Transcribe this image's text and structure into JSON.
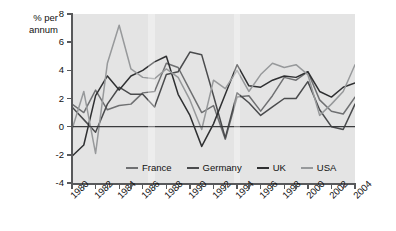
{
  "axis_title": "% per annum",
  "legend": {
    "position": "inside-bottom",
    "items": [
      {
        "label": "France",
        "color": "#6f7072",
        "icon": "legend-line-icon"
      },
      {
        "label": "Germany",
        "color": "#4a4b4d",
        "icon": "legend-line-icon"
      },
      {
        "label": "UK",
        "color": "#2f3032",
        "icon": "legend-line-icon"
      },
      {
        "label": "USA",
        "color": "#97999b",
        "icon": "legend-line-icon"
      }
    ]
  },
  "chart_data": {
    "type": "line",
    "title": "",
    "subtitle": "",
    "xlabel": "",
    "ylabel": "% per annum",
    "ylim": [
      -4,
      8
    ],
    "xlim": [
      1980,
      2004
    ],
    "grid": false,
    "zero_line": true,
    "legend_position": "inside-bottom",
    "y_ticks": [
      -4,
      -2,
      0,
      2,
      4,
      6,
      8
    ],
    "y_tick_labels": [
      "-4",
      "-2",
      "0",
      "2",
      "4",
      "6",
      "8"
    ],
    "x_ticks": [
      1980,
      1981,
      1982,
      1983,
      1984,
      1985,
      1986,
      1987,
      1988,
      1989,
      1990,
      1991,
      1992,
      1993,
      1994,
      1995,
      1996,
      1997,
      1998,
      1999,
      2000,
      2001,
      2002,
      2003,
      2004
    ],
    "x_tick_labels": [
      "1980",
      "1982",
      "1984",
      "1986",
      "1988",
      "1990",
      "1992",
      "1994",
      "1996",
      "1998",
      "2000",
      "2002",
      "2004"
    ],
    "x_labeled_years": [
      1980,
      1982,
      1984,
      1986,
      1988,
      1990,
      1992,
      1994,
      1996,
      1998,
      2000,
      2002,
      2004
    ],
    "x": [
      1980,
      1981,
      1982,
      1983,
      1984,
      1985,
      1986,
      1987,
      1988,
      1989,
      1990,
      1991,
      1992,
      1993,
      1994,
      1995,
      1996,
      1997,
      1998,
      1999,
      2000,
      2001,
      2002,
      2003,
      2004
    ],
    "series": [
      {
        "name": "France",
        "color": "#6f7072",
        "values": [
          1.6,
          1.0,
          2.6,
          1.2,
          1.5,
          1.6,
          2.4,
          2.5,
          4.5,
          4.2,
          2.6,
          1.0,
          1.5,
          -0.9,
          2.1,
          2.2,
          1.1,
          2.2,
          3.5,
          3.3,
          3.9,
          1.9,
          1.1,
          0.9,
          2.1
        ]
      },
      {
        "name": "Germany",
        "color": "#4a4b4d",
        "values": [
          1.4,
          0.5,
          -0.4,
          1.6,
          2.8,
          2.3,
          2.3,
          1.4,
          3.7,
          3.9,
          5.3,
          5.1,
          2.2,
          -0.8,
          2.4,
          1.7,
          0.8,
          1.4,
          2.0,
          2.0,
          3.2,
          1.2,
          0.0,
          -0.2,
          1.6
        ]
      },
      {
        "name": "UK",
        "color": "#2f3032",
        "values": [
          -2.1,
          -1.3,
          2.2,
          3.6,
          2.6,
          3.6,
          4.0,
          4.6,
          5.0,
          2.3,
          0.8,
          -1.4,
          0.2,
          2.3,
          4.4,
          2.9,
          2.8,
          3.3,
          3.6,
          3.5,
          3.9,
          2.5,
          2.1,
          2.8,
          3.1
        ]
      },
      {
        "name": "USA",
        "color": "#97999b",
        "values": [
          -0.2,
          2.5,
          -1.9,
          4.5,
          7.2,
          4.1,
          3.5,
          3.4,
          4.1,
          3.5,
          1.9,
          -0.2,
          3.3,
          2.7,
          4.0,
          2.5,
          3.7,
          4.5,
          4.2,
          4.4,
          3.7,
          0.8,
          1.6,
          2.5,
          4.4
        ]
      }
    ]
  }
}
